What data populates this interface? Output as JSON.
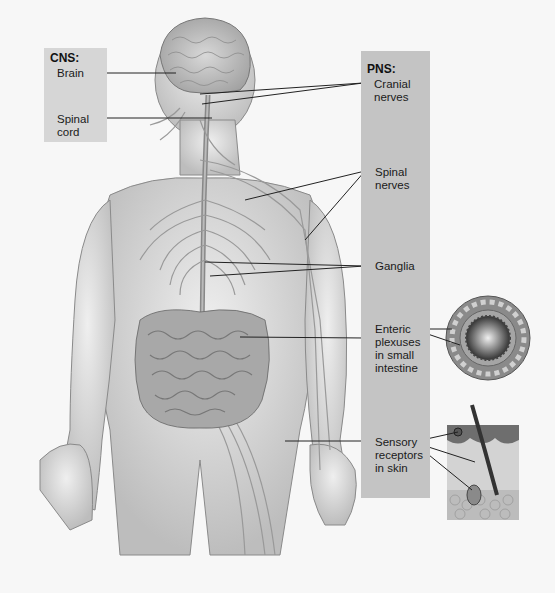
{
  "figure": {
    "type": "anatomical-diagram"
  },
  "cns": {
    "heading": "CNS:",
    "labels": [
      {
        "id": "brain",
        "text": "Brain"
      },
      {
        "id": "spinal-cord",
        "text": "Spinal\ncord"
      }
    ]
  },
  "pns": {
    "heading": "PNS:",
    "labels": [
      {
        "id": "cranial-nerves",
        "text": "Cranial\nnerves"
      },
      {
        "id": "spinal-nerves",
        "text": "Spinal\nnerves"
      },
      {
        "id": "ganglia",
        "text": "Ganglia"
      },
      {
        "id": "enteric-plexuses",
        "text": "Enteric\nplexuses\nin small\nintestine"
      },
      {
        "id": "sensory-receptors",
        "text": "Sensory\nreceptors\nin skin"
      }
    ]
  },
  "insets": [
    {
      "id": "small-intestine-cross-section"
    },
    {
      "id": "skin-cross-section"
    }
  ],
  "colors": {
    "cns_box": "#d6d6d6",
    "pns_box": "#c4c4c4",
    "background": "#f7f7f7",
    "leader_line": "#222222"
  }
}
